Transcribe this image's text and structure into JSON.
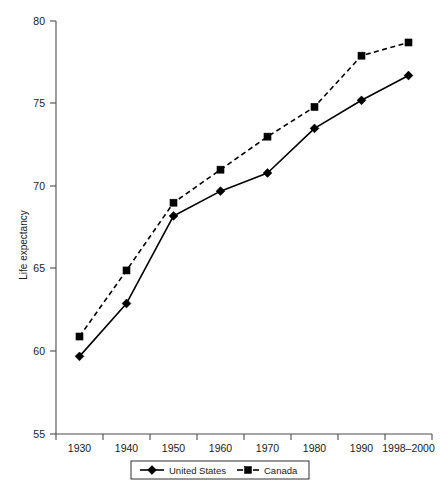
{
  "chart_data": {
    "type": "line",
    "title": "",
    "xlabel": "",
    "ylabel": "Life expectancy",
    "categories": [
      "1930",
      "1940",
      "1950",
      "1960",
      "1970",
      "1980",
      "1990",
      "1998–2000"
    ],
    "ylim": [
      55,
      80
    ],
    "yticks": [
      55,
      60,
      65,
      70,
      75,
      80
    ],
    "ytick_labels": [
      "55",
      "60",
      "65",
      "70",
      "75",
      "80"
    ],
    "grid": false,
    "legend_position": "bottom-center",
    "series": [
      {
        "name": "United States",
        "marker": "diamond",
        "linestyle": "solid",
        "color": "#000000",
        "values": [
          59.7,
          62.9,
          68.2,
          69.7,
          70.8,
          73.5,
          75.2,
          76.7
        ]
      },
      {
        "name": "Canada",
        "marker": "square",
        "linestyle": "dashed",
        "color": "#000000",
        "values": [
          60.9,
          64.9,
          69.0,
          71.0,
          73.0,
          74.8,
          77.9,
          78.7
        ]
      }
    ]
  },
  "legend": {
    "entries": [
      {
        "label": "United States"
      },
      {
        "label": "Canada"
      }
    ]
  },
  "axes": {
    "y_title": "Life expectancy"
  }
}
